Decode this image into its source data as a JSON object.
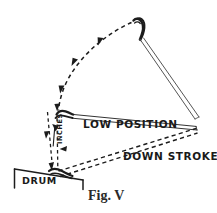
{
  "figure": {
    "caption": "Fig. V",
    "labels": {
      "low_position": "LOW POSITION",
      "down_stroke": "DOWN STROKE",
      "drum": "DRUM",
      "inches": "INCHES"
    },
    "colors": {
      "background": "#ffffff",
      "ink": "#1c1c1c",
      "light_ink": "#555555",
      "caption": "#2a2a2a"
    },
    "geometry": {
      "apex_x": 152,
      "apex_y": 18,
      "drum_contact_x": 56,
      "drum_contact_y": 172,
      "low_position_tip_x": 60,
      "low_position_tip_y": 113,
      "stick_right_end_x": 196,
      "stick_right_end_y": 122
    }
  }
}
